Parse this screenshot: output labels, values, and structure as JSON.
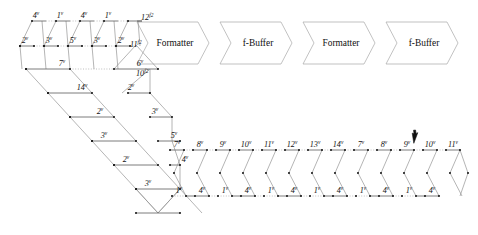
{
  "diagram": {
    "cursor": {
      "name": "mouse-pointer",
      "x": 412,
      "y": 131
    },
    "blocks": [
      {
        "id": "blk1",
        "label": "Formatter",
        "x": 137,
        "y": 22,
        "w": 72,
        "h": 42
      },
      {
        "id": "blk2",
        "label": "f-Buffer",
        "x": 220,
        "y": 22,
        "w": 72,
        "h": 42
      },
      {
        "id": "blk3",
        "label": "Formatter",
        "x": 303,
        "y": 22,
        "w": 72,
        "h": 42
      },
      {
        "id": "blk4",
        "label": "f-Buffer",
        "x": 386,
        "y": 22,
        "w": 72,
        "h": 42
      }
    ],
    "port_labels": [
      {
        "text": "12",
        "sup": "f2",
        "x": 141,
        "y": 20
      },
      {
        "text": "11",
        "sup": "f2",
        "x": 130,
        "y": 47
      },
      {
        "text": "10",
        "sup": "f2",
        "x": 136,
        "y": 76
      }
    ],
    "chain_top": {
      "baseline_y": 21,
      "mid_y": 46,
      "bot_y": 69,
      "x_start": 18,
      "step": 24,
      "top_labels": [
        "4",
        "1",
        "4",
        "1"
      ],
      "bot_labels": [
        "2",
        "3",
        "5",
        "3",
        "2"
      ],
      "sup": "v"
    },
    "chain_mid": {
      "labels_row1": [
        "7",
        "6"
      ],
      "labels_row2": [
        "14",
        "2"
      ],
      "labels_row3": [
        "2",
        "3"
      ],
      "labels_row4": [
        "3",
        "5"
      ],
      "labels_row5": [
        "2",
        "4"
      ],
      "labels_row6": [
        "3"
      ],
      "sup": "v"
    },
    "chain_bottom": {
      "top_labels": [
        "7",
        "8",
        "9",
        "10",
        "11",
        "12",
        "13",
        "14",
        "7",
        "8",
        "9",
        "10",
        "11"
      ],
      "bottom_labels": [
        "1",
        "4",
        "1",
        "4",
        "1",
        "4",
        "1",
        "4",
        "1",
        "4",
        "1",
        "4"
      ],
      "sup": "v",
      "top_y": 150,
      "bot_y": 196,
      "x_start": 170,
      "step": 23
    },
    "colors": {
      "edge": "#8c8c8c",
      "edge_strong": "#5a5a5a",
      "node": "#1b1b1b",
      "block_stroke": "#a8a8a8",
      "text": "#111111",
      "background": "#ffffff"
    }
  }
}
